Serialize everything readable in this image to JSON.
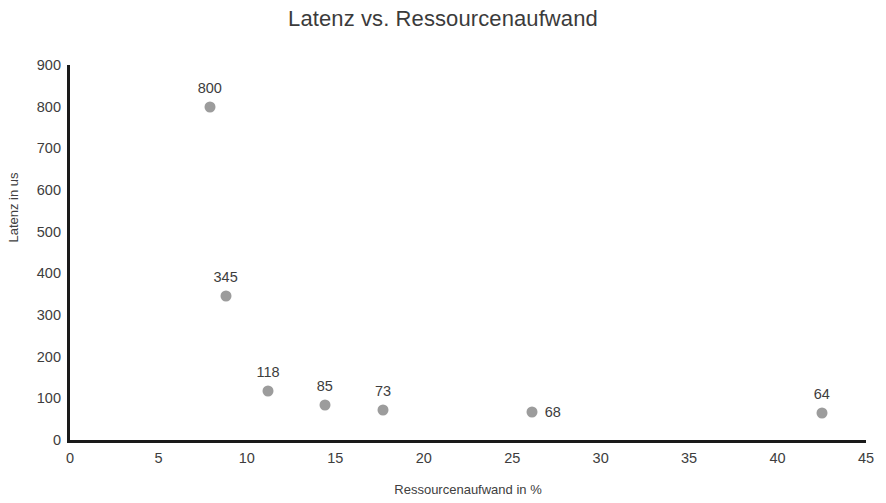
{
  "chart_data": {
    "type": "scatter",
    "title": "Latenz vs. Ressourcenaufwand",
    "xlabel": "Ressourcenaufwand in %",
    "ylabel": "Latenz in us",
    "xlim": [
      0,
      45
    ],
    "ylim": [
      0,
      900
    ],
    "xticks": [
      "0",
      "5",
      "10",
      "15",
      "20",
      "25",
      "30",
      "35",
      "40",
      "45"
    ],
    "yticks": [
      "0",
      "100",
      "200",
      "300",
      "400",
      "500",
      "600",
      "700",
      "800",
      "900"
    ],
    "grid": false,
    "legend": "none",
    "marker_color": "#9c9c9c",
    "axis_color": "#1a1a1a",
    "points": [
      {
        "x": 7.9,
        "y": 800,
        "label": "800",
        "label_pos": "above"
      },
      {
        "x": 8.8,
        "y": 345,
        "label": "345",
        "label_pos": "above"
      },
      {
        "x": 11.2,
        "y": 118,
        "label": "118",
        "label_pos": "above"
      },
      {
        "x": 14.4,
        "y": 85,
        "label": "85",
        "label_pos": "above"
      },
      {
        "x": 17.7,
        "y": 73,
        "label": "73",
        "label_pos": "above"
      },
      {
        "x": 26.1,
        "y": 68,
        "label": "68",
        "label_pos": "right"
      },
      {
        "x": 42.5,
        "y": 64,
        "label": "64",
        "label_pos": "above"
      }
    ]
  }
}
